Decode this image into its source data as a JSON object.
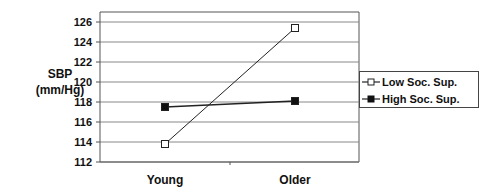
{
  "chart_data": {
    "type": "line",
    "title": "",
    "xlabel": "",
    "ylabel": "SBP (mm/Hg)",
    "categories": [
      "Young",
      "Older"
    ],
    "series": [
      {
        "name": "Low Soc. Sup.",
        "marker": "open-square",
        "values": [
          113.8,
          125.4
        ]
      },
      {
        "name": "High Soc. Sup.",
        "marker": "filled-square",
        "values": [
          117.5,
          118.1
        ]
      }
    ],
    "ylim": [
      112,
      127
    ],
    "yticks": [
      112,
      114,
      116,
      118,
      120,
      122,
      124,
      126
    ],
    "grid": true,
    "legend_position": "right"
  },
  "ylabel_lines": [
    "SBP",
    "(mm/Hg)"
  ],
  "legend": {
    "items": [
      "Low Soc. Sup.",
      "High Soc. Sup."
    ]
  },
  "colors": {
    "line": "#222222",
    "grid": "#888888",
    "axis": "#555555"
  }
}
